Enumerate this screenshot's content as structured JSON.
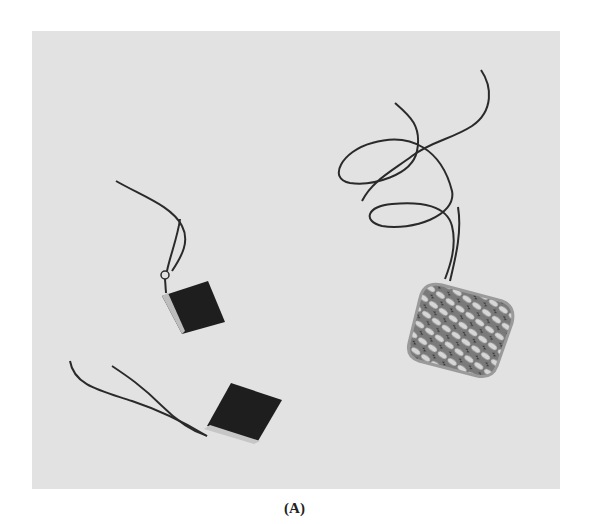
{
  "figure": {
    "caption": "(A)",
    "items": [
      {
        "name": "dark-square-module-upper",
        "description": "small dark square module with twisted lead wires"
      },
      {
        "name": "dark-square-module-lower",
        "description": "small dark square module with twisted lead wires"
      },
      {
        "name": "mesh-square-module",
        "description": "square module with patterned mesh face and long coiled lead wires"
      }
    ],
    "colors": {
      "background": "#e2e2e2",
      "module_dark": "#1e1e1e",
      "wire": "#2a2a2a",
      "mesh_frame": "#9a9a9a"
    }
  }
}
